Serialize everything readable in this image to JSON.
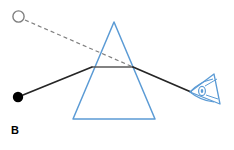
{
  "figure": {
    "panel_label": "B",
    "title": "",
    "background_color": "#ffffff"
  },
  "colors": {
    "prism_stroke": "#5b9bd5",
    "ray_solid": "#262626",
    "ray_dashed": "#808080",
    "normal_line": "#595959",
    "object_dot_fill": "#000000",
    "image_circle_stroke": "#7f7f7f",
    "eye_stroke": "#5b9bd5",
    "label_color": "#000000"
  },
  "elements": {
    "object_dot": {
      "name": "object-point",
      "label": "",
      "cx": 18,
      "cy": 97,
      "r": 5.2,
      "fill": "#000000"
    },
    "image_circle": {
      "name": "virtual-image-point",
      "label": "",
      "cx": 18.5,
      "cy": 16.5,
      "r": 5.6,
      "fill": "none",
      "stroke": "#7f7f7f",
      "stroke_width": 1.4
    },
    "prism": {
      "name": "triangular-prism",
      "apex": {
        "x": 114,
        "y": 22
      },
      "base_left": {
        "x": 73,
        "y": 119
      },
      "base_right": {
        "x": 155,
        "y": 119
      },
      "stroke": "#5b9bd5",
      "stroke_width": 1.5,
      "fill": "none"
    },
    "incident_ray": {
      "name": "incident-ray",
      "from": {
        "x": 23,
        "y": 95
      },
      "to": {
        "x": 92,
        "y": 67
      },
      "stroke": "#262626",
      "stroke_width": 1.8
    },
    "internal_ray": {
      "name": "internal-ray",
      "from": {
        "x": 92,
        "y": 67
      },
      "to": {
        "x": 133,
        "y": 67
      },
      "stroke": "#595959",
      "stroke_width": 1.7
    },
    "refracted_ray": {
      "name": "refracted-ray",
      "from": {
        "x": 133,
        "y": 67
      },
      "to": {
        "x": 191,
        "y": 92
      },
      "stroke": "#262626",
      "stroke_width": 1.8
    },
    "sight_line": {
      "name": "line-of-sight-dashed",
      "from": {
        "x": 25,
        "y": 20
      },
      "to": {
        "x": 133,
        "y": 67
      },
      "stroke": "#808080",
      "stroke_width": 1.2,
      "dash": "4 3"
    },
    "eye": {
      "name": "observer-eye",
      "apex": {
        "x": 190,
        "y": 92
      },
      "top": {
        "x": 214,
        "y": 74
      },
      "bottom": {
        "x": 220,
        "y": 104
      },
      "pupil": {
        "cx": 202,
        "cy": 91,
        "rx": 3.4,
        "ry": 4.6
      },
      "stroke": "#5b9bd5",
      "stroke_width": 1.3
    }
  }
}
